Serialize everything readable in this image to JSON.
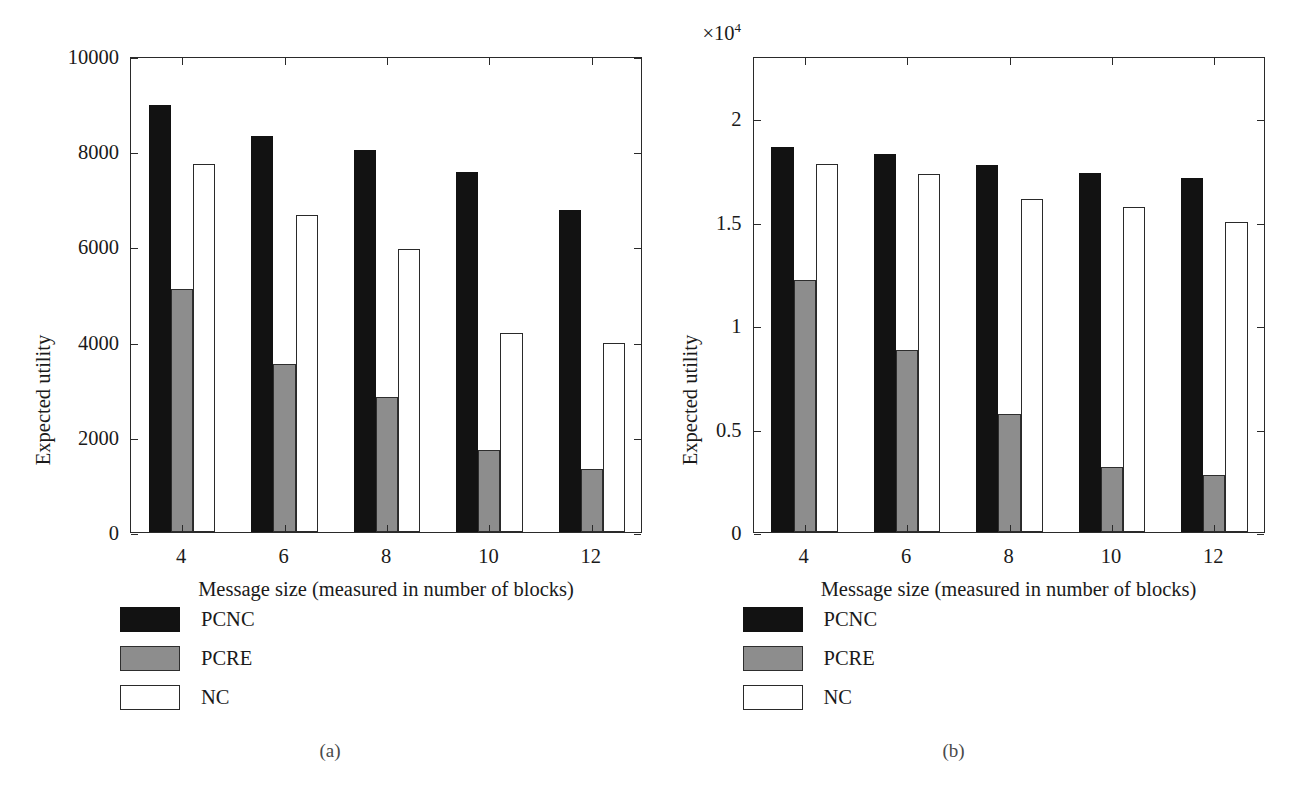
{
  "figure": {
    "background_color": "#ffffff",
    "series_colors": {
      "PCNC": "#121212",
      "PCRE": "#8d8d8d",
      "NC": "#ffffff"
    },
    "subfigures": [
      {
        "caption": "(a)",
        "multiplier_label": "",
        "legend": [
          {
            "label": "PCNC",
            "color": "#121212"
          },
          {
            "label": "PCRE",
            "color": "#8d8d8d"
          },
          {
            "label": "NC",
            "color": "#ffffff"
          }
        ]
      },
      {
        "caption": "(b)",
        "multiplier_label": "×10",
        "multiplier_exponent": "4",
        "legend": [
          {
            "label": "PCNC",
            "color": "#121212"
          },
          {
            "label": "PCRE",
            "color": "#8d8d8d"
          },
          {
            "label": "NC",
            "color": "#ffffff"
          }
        ]
      }
    ]
  },
  "chart_data": [
    {
      "type": "bar",
      "title": "",
      "xlabel": "Message size (measured in number of blocks)",
      "ylabel": "Expected utility",
      "categories": [
        "4",
        "6",
        "8",
        "10",
        "12"
      ],
      "xlim": [
        3,
        13
      ],
      "ylim": [
        0,
        10000
      ],
      "yticks": [
        0,
        2000,
        4000,
        6000,
        8000,
        10000
      ],
      "ytick_labels": [
        "0",
        "2000",
        "4000",
        "6000",
        "8000",
        "10000"
      ],
      "grid": false,
      "legend_position": "below-left",
      "series": [
        {
          "name": "PCNC",
          "values": [
            8970,
            8330,
            8020,
            7560,
            6760
          ]
        },
        {
          "name": "PCRE",
          "values": [
            5100,
            3520,
            2830,
            1720,
            1330
          ]
        },
        {
          "name": "NC",
          "values": [
            7730,
            6660,
            5940,
            4190,
            3980
          ]
        }
      ]
    },
    {
      "type": "bar",
      "title": "",
      "xlabel": "Message size (measured in number of blocks)",
      "ylabel": "Expected utility",
      "categories": [
        "4",
        "6",
        "8",
        "10",
        "12"
      ],
      "xlim": [
        3,
        13
      ],
      "ylim": [
        0,
        23000
      ],
      "yticks": [
        0,
        5000,
        10000,
        15000,
        20000
      ],
      "ytick_labels": [
        "0",
        "0.5",
        "1",
        "1.5",
        "2"
      ],
      "y_multiplier": 10000,
      "grid": false,
      "legend_position": "below-left",
      "series": [
        {
          "name": "PCNC",
          "values": [
            18600,
            18250,
            17750,
            17350,
            17100
          ]
        },
        {
          "name": "PCRE",
          "values": [
            12200,
            8800,
            5700,
            3150,
            2750
          ]
        },
        {
          "name": "NC",
          "values": [
            17800,
            17300,
            16100,
            15700,
            15000
          ]
        }
      ]
    }
  ]
}
